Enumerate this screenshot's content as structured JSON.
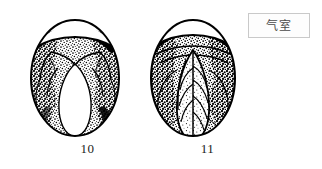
{
  "figure": {
    "background_color": "#ffffff",
    "ink_color": "#000000",
    "caption_color": "#1a1a1a",
    "specimens": [
      {
        "number": "10",
        "name": "egg-candling-diagram-10",
        "description_icon": "egg-outline-icon"
      },
      {
        "number": "11",
        "name": "egg-candling-diagram-11",
        "description_icon": "egg-outline-icon"
      }
    ]
  },
  "callout": {
    "label": "气室",
    "border_color": "#c9c9c9",
    "fill_color": "#fdfdfd",
    "text_color": "#4a4a4a"
  }
}
